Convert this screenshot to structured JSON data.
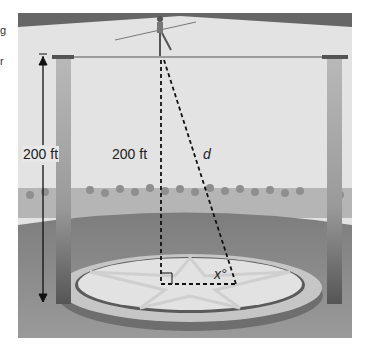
{
  "edge_fragments": [
    "g",
    "r"
  ],
  "labels": {
    "pole_height": "200 ft",
    "vertical_height": "200 ft",
    "hypotenuse": "d",
    "angle": "x°"
  },
  "colors": {
    "background_wall": "#e4e4e4",
    "ceiling": "#6a6a6a",
    "pole_top": "#9a9a9a",
    "pole_bottom": "#4a4a4a",
    "floor": "#8c8c8c",
    "ring": "#c9c9c9",
    "ring_inner": "#e6e6e6",
    "dash": "#1a1a1a"
  }
}
